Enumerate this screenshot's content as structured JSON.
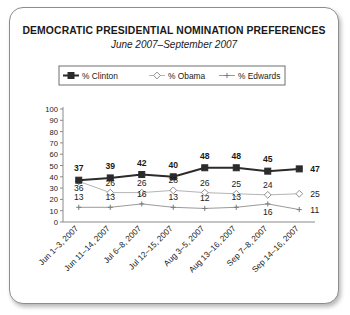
{
  "chart_data": {
    "type": "line",
    "title": "DEMOCRATIC PRESIDENTIAL NOMINATION PREFERENCES",
    "subtitle": "June 2007–September 2007",
    "xlabel": "",
    "ylabel": "",
    "ylim": [
      0,
      100
    ],
    "yticks": [
      0,
      10,
      20,
      30,
      40,
      50,
      60,
      70,
      80,
      90,
      100
    ],
    "grid": false,
    "legend_position": "top-center",
    "categories": [
      "Jun 1–3, 2007",
      "Jun 11–14, 2007",
      "Jul 6–8, 2007",
      "Jul 12–15, 2007",
      "Aug 3–5, 2007",
      "Aug 13–16, 2007",
      "Sep 7–8, 2007",
      "Sep 14–16, 2007"
    ],
    "series": [
      {
        "name": "% Clinton",
        "values": [
          37,
          39,
          42,
          40,
          48,
          48,
          45,
          47
        ],
        "color": "#2b2b2b",
        "marker": "square"
      },
      {
        "name": "% Obama",
        "values": [
          36,
          26,
          26,
          28,
          26,
          25,
          24,
          25
        ],
        "color": "#b4b4b4",
        "marker": "diamond"
      },
      {
        "name": "% Edwards",
        "values": [
          13,
          13,
          16,
          13,
          12,
          13,
          16,
          11
        ],
        "color": "#9a9a9a",
        "marker": "plus"
      }
    ]
  },
  "colors": {
    "card_border": "#8d8d8d",
    "axis": "#8a8a8a",
    "text": "#1a1a1a"
  }
}
